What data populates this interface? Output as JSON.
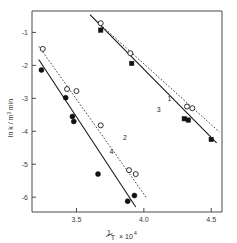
{
  "chart_data": {
    "type": "scatter",
    "title": "",
    "subtitle": "",
    "xlabel": "1/T × 10⁴",
    "xlabel_parts": {
      "numerator": "1",
      "denominator": "T",
      "times": "× 10",
      "exponent": "4"
    },
    "ylabel": "ln k / m³ min",
    "ylabel_parts": {
      "lead": "ln k",
      "slash": "/ m",
      "sup": "3",
      "unit": "min"
    },
    "xlim": [
      3.17,
      4.58
    ],
    "ylim": [
      -6.45,
      -0.35
    ],
    "xticks": [
      3.5,
      4.0,
      4.5
    ],
    "xtick_labels": [
      "3.5",
      "4.0",
      "4.5"
    ],
    "yticks": [
      -1,
      -2,
      -3,
      -4,
      -5,
      -6
    ],
    "ytick_labels": [
      "-1",
      "-2",
      "-3",
      "-4",
      "-5",
      "-6"
    ],
    "grid": false,
    "legend": "inline-line-labels",
    "series": [
      {
        "name": "1",
        "label": "1",
        "style": "dashed",
        "marker": "open-circle",
        "label_x": 4.19,
        "label_y": -3.08,
        "fit_x": [
          3.62,
          4.56
        ],
        "fit_y": [
          -0.55,
          -4.02
        ],
        "x": [
          3.68,
          3.9,
          4.32,
          4.36
        ],
        "y": [
          -0.72,
          -1.63,
          -3.25,
          -3.3
        ]
      },
      {
        "name": "2",
        "label": "2",
        "style": "dashed",
        "marker": "open-circle",
        "label_x": 3.86,
        "label_y": -4.28,
        "fit_x": [
          3.22,
          4.02
        ],
        "fit_y": [
          -1.42,
          -6.02
        ],
        "x": [
          3.25,
          3.43,
          3.5,
          3.68,
          3.89,
          3.94
        ],
        "y": [
          -1.5,
          -2.72,
          -2.78,
          -3.82,
          -5.18,
          -5.3
        ]
      },
      {
        "name": "3",
        "label": "3",
        "style": "solid",
        "marker": "filled-square",
        "label_x": 4.11,
        "label_y": -3.42,
        "fit_x": [
          3.6,
          4.54
        ],
        "fit_y": [
          -0.46,
          -4.35
        ],
        "x": [
          3.68,
          3.91,
          4.3,
          4.33,
          4.5
        ],
        "y": [
          -0.93,
          -1.94,
          -3.62,
          -3.66,
          -4.25
        ]
      },
      {
        "name": "4",
        "label": "4",
        "style": "solid",
        "marker": "filled-circle",
        "label_x": 3.76,
        "label_y": -4.68,
        "fit_x": [
          3.22,
          3.94
        ],
        "fit_y": [
          -1.82,
          -6.3
        ],
        "x": [
          3.24,
          3.42,
          3.47,
          3.48,
          3.66,
          3.88,
          3.93
        ],
        "y": [
          -2.14,
          -2.98,
          -3.55,
          -3.7,
          -5.3,
          -6.12,
          -5.95
        ]
      }
    ]
  },
  "axes": {
    "x_title_display": "1/T × 10⁴",
    "y_title_display": "ln k / m³ min"
  }
}
